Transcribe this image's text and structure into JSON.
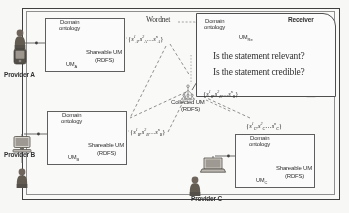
{
  "figure": {
    "outer_frame": "diagram-border"
  },
  "providers": [
    {
      "id": "A",
      "name": "Provider A",
      "device_icon": "mobile-phone-icon",
      "person_icon": "person-icon",
      "box": {
        "ontology_label_line1": "Domain",
        "ontology_label_line2": "ontology",
        "ontology_icon": "tree-hierarchy-icon",
        "target_ontology_icon": "tree-hierarchy-icon",
        "store_label": "UM",
        "store_sub": "A",
        "store_icon": "database-cylinder-icon",
        "shareable_line1": "Shareable UM",
        "shareable_line2": "(RDFS)"
      },
      "statement_set": {
        "open": "{",
        "items": [
          "s",
          "s",
          "s"
        ],
        "subs": [
          "A",
          "A",
          "A"
        ],
        "sups": [
          "1",
          "2",
          "n"
        ],
        "ellipsis": "…",
        "close": "}"
      }
    },
    {
      "id": "B",
      "name": "Provider B",
      "device_icon": "desktop-computer-icon",
      "person_icon": "person-icon",
      "box": {
        "ontology_label_line1": "Domain",
        "ontology_label_line2": "ontology",
        "ontology_icon": "tree-hierarchy-icon",
        "target_ontology_icon": "tree-hierarchy-icon",
        "store_label": "UM",
        "store_sub": "B",
        "store_icon": "database-cylinder-icon",
        "shareable_line1": "Shareable UM",
        "shareable_line2": "(RDFS)"
      },
      "statement_set": {
        "open": "{",
        "items": [
          "s",
          "s",
          "s"
        ],
        "subs": [
          "B",
          "B",
          "B"
        ],
        "sups": [
          "1",
          "2",
          "n"
        ],
        "ellipsis": "…",
        "close": "}"
      }
    },
    {
      "id": "C",
      "name": "Provider C",
      "device_icon": "laptop-icon",
      "person_icon": "person-icon",
      "box": {
        "ontology_label_line1": "Domain",
        "ontology_label_line2": "ontology",
        "ontology_icon": "tree-hierarchy-icon",
        "target_ontology_icon": "tree-hierarchy-icon",
        "store_label": "UM",
        "store_sub": "C",
        "store_icon": "database-cylinder-icon",
        "shareable_line1": "Shareable UM",
        "shareable_line2": "(RDFS)"
      },
      "statement_set": {
        "open": "{",
        "items": [
          "s",
          "s",
          "s"
        ],
        "subs": [
          "C",
          "C",
          "C"
        ],
        "sups": [
          "1",
          "2",
          "n"
        ],
        "ellipsis": "…",
        "close": "}"
      }
    }
  ],
  "wordnet": {
    "label": "Wordnet",
    "icon": "dashed-connector"
  },
  "collected": {
    "line1": "Collected UM",
    "line2": "(RDFS)",
    "ontology_icon": "tree-hierarchy-icon",
    "statement_set": {
      "open": "{",
      "subs": [
        "R",
        "R",
        "R"
      ],
      "sups": [
        "1",
        "2",
        "n"
      ],
      "ellipsis": "…",
      "close": "}"
    }
  },
  "receiver": {
    "title": "Receiver",
    "ontology_label_line1": "Domain",
    "ontology_label_line2": "ontology",
    "ontology_icon": "tree-hierarchy-icon",
    "store_label": "UM",
    "store_sub": "Re",
    "store_icon": "database-cylinder-icon",
    "person_icon": "person-icon",
    "questions": [
      "Is the statement relevant?",
      "Is the statement credible?"
    ]
  },
  "colors": {
    "ink": "#2b2b2b",
    "frame": "#3a3a3a",
    "box_border": "#5b5b5b",
    "paper": "#fbfbfa",
    "line": "#555555"
  }
}
